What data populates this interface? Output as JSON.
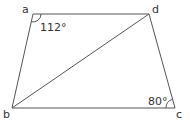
{
  "figure": {
    "type": "quadrilateral-geometry",
    "stroke_color": "#555555",
    "text_color": "#333333",
    "vertices": {
      "a": {
        "label": "a",
        "x": 33,
        "y": 14
      },
      "b": {
        "label": "b",
        "x": 12,
        "y": 108
      },
      "c": {
        "label": "c",
        "x": 175,
        "y": 108
      },
      "d": {
        "label": "d",
        "x": 149,
        "y": 14
      }
    },
    "segments": [
      "ad",
      "dc",
      "cb",
      "ba",
      "bd"
    ],
    "angles": {
      "a": {
        "value": "112°"
      },
      "c": {
        "value": "80°"
      }
    }
  }
}
